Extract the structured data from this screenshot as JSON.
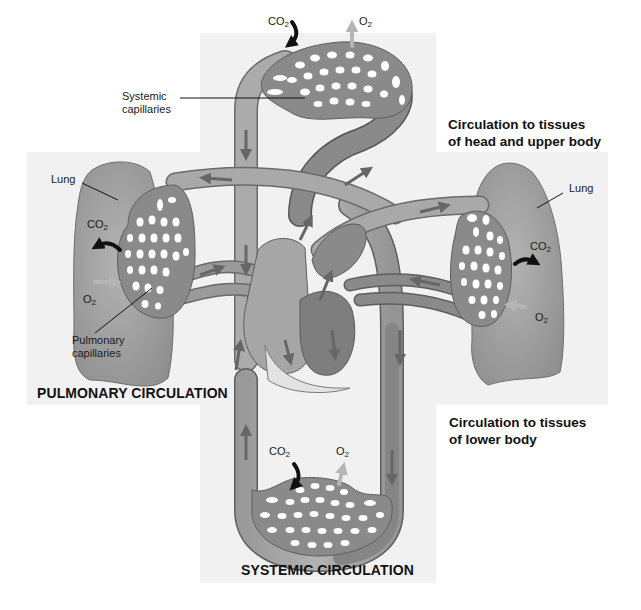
{
  "diagram": {
    "title_upper": [
      "Circulation to tissues",
      "of head and upper body"
    ],
    "title_lower": [
      "Circulation to tissues",
      "of lower body"
    ],
    "section_pulmonary": "PULMONARY CIRCULATION",
    "section_systemic": "SYSTEMIC CIRCULATION",
    "labels": {
      "systemic_capillaries": [
        "Systemic",
        "capillaries"
      ],
      "pulmonary_capillaries": [
        "Pulmonary",
        "capillaries"
      ],
      "lung_left": "Lung",
      "lung_right": "Lung"
    },
    "gases": {
      "co2": "CO",
      "o2": "O",
      "subscript": "2"
    },
    "colors": {
      "panel_bg": "#f1f1f1",
      "lung": "#9c9c9c",
      "vessel_light": "#a9a9a9",
      "vessel_dark": "#7c7c7c",
      "vessel_outline": "#5e5e5e",
      "capillary_holes": "#ffffff",
      "arrow_dark": "#111111",
      "arrow_light": "#b8b8b8",
      "flow_arrow": "#666666"
    }
  }
}
